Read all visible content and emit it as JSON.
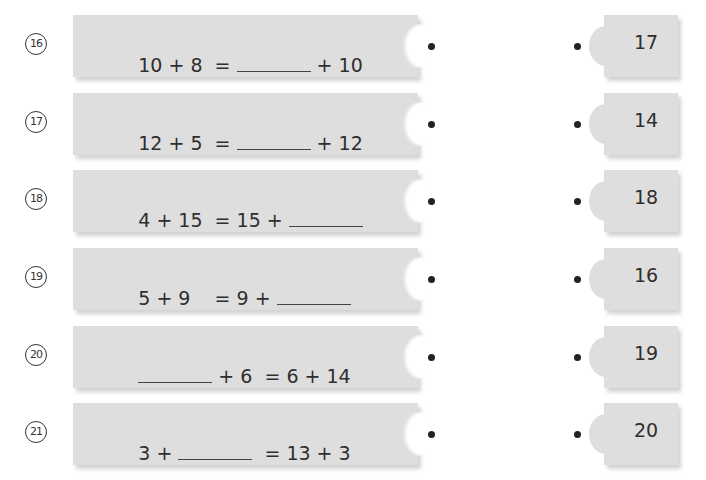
{
  "exercises": [
    {
      "number": "16",
      "parts": [
        "10 + 8  = ",
        "BLANK",
        " + 10"
      ],
      "answer_choice": "17"
    },
    {
      "number": "17",
      "parts": [
        "12 + 5  = ",
        "BLANK",
        " + 12"
      ],
      "answer_choice": "14"
    },
    {
      "number": "18",
      "parts": [
        "4 + 15  = 15 + ",
        "BLANK",
        ""
      ],
      "answer_choice": "18"
    },
    {
      "number": "19",
      "parts": [
        "5 + 9    = 9 + ",
        "BLANK",
        ""
      ],
      "answer_choice": "16"
    },
    {
      "number": "20",
      "parts": [
        "",
        "BLANK",
        " + 6  = 6 + 14"
      ],
      "answer_choice": "19"
    },
    {
      "number": "21",
      "parts": [
        "3 + ",
        "BLANK",
        "  = 13 + 3"
      ],
      "answer_choice": "20"
    }
  ]
}
